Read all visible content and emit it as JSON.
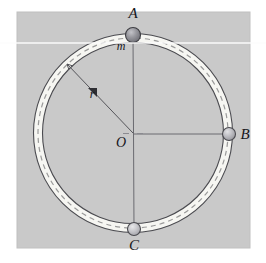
{
  "figure": {
    "kind": "physics-diagram",
    "panel": {
      "background_color": "#c9c9c9",
      "outer_background_color": "#ffffff",
      "x": 17,
      "y": 12,
      "width": 233,
      "height": 236
    },
    "ring": {
      "name": "circular-track",
      "center": {
        "x": 133,
        "y": 133
      },
      "radius": 95,
      "tube_thickness": 9,
      "fill_color": "#f6f6f2",
      "outline_color": "#4b4b50",
      "dash_color": "#9a9a9a",
      "dash_pattern": "5 4"
    },
    "center_point": {
      "label": "O",
      "x": 133,
      "y": 133
    },
    "radius_line": {
      "label": "r",
      "label_x": 91,
      "label_y": 93,
      "from": {
        "x": 133,
        "y": 133
      },
      "to": {
        "x": 67,
        "y": 64
      },
      "color": "#55555a"
    },
    "axis_lines": {
      "vertical_color": "#6a6a70",
      "horizontal_color": "#6a6a70"
    },
    "beads": [
      {
        "label": "A",
        "sub_label": "m",
        "position": "top",
        "x": 133,
        "y": 35,
        "radius": 7.5,
        "fill_color": "#8e8e94",
        "stroke_color": "#3d3d42",
        "label_x": 133,
        "label_y": 18,
        "sub_label_x": 121,
        "sub_label_y": 50
      },
      {
        "label": "B",
        "sub_label": "",
        "position": "right",
        "x": 229,
        "y": 134,
        "radius": 6.5,
        "fill_color": "#b4b4b8",
        "stroke_color": "#4a4a4f",
        "label_x": 245,
        "label_y": 139,
        "sub_label_x": 0,
        "sub_label_y": 0
      },
      {
        "label": "C",
        "sub_label": "",
        "position": "bottom",
        "x": 134,
        "y": 229,
        "radius": 6.5,
        "fill_color": "#c2c2c6",
        "stroke_color": "#4a4a4f",
        "label_x": 134,
        "label_y": 250,
        "sub_label_x": 0,
        "sub_label_y": 0
      }
    ],
    "scan_artifact": {
      "name": "horizontal-scan-line",
      "y": 43,
      "color": "#fdfdfd"
    }
  }
}
